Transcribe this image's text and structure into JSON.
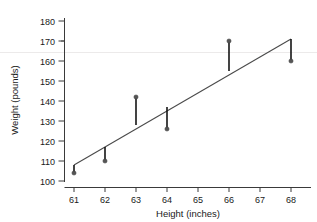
{
  "chart_data": {
    "type": "scatter",
    "title": "",
    "xlabel": "Height (inches)",
    "ylabel": "Weight (pounds)",
    "xlim": [
      60.4,
      68.6
    ],
    "ylim": [
      98,
      183
    ],
    "xticks": [
      61,
      62,
      63,
      64,
      65,
      66,
      67,
      68
    ],
    "yticks": [
      100,
      110,
      120,
      130,
      140,
      150,
      160,
      170,
      180
    ],
    "grid": false,
    "legend": null,
    "x": [
      61,
      62,
      63,
      64,
      66,
      68
    ],
    "y": [
      104,
      110,
      142,
      126,
      170,
      160
    ],
    "fitted": [
      108,
      117,
      128,
      137,
      155,
      171
    ],
    "residual_segments": [
      {
        "x": 61,
        "y_point": 104,
        "y_line": 108
      },
      {
        "x": 62,
        "y_point": 110,
        "y_line": 117
      },
      {
        "x": 63,
        "y_point": 142,
        "y_line": 128
      },
      {
        "x": 64,
        "y_point": 126,
        "y_line": 137
      },
      {
        "x": 66,
        "y_point": 170,
        "y_line": 155
      },
      {
        "x": 68,
        "y_point": 160,
        "y_line": 171
      }
    ],
    "trendline": {
      "x_start": 61,
      "y_start": 108,
      "x_end": 68,
      "y_end": 171
    },
    "colors": {
      "point": "#555555",
      "residual": "#151515",
      "trendline": "#4a4a4a",
      "axis": "#3a3a3a",
      "gridline": "#eceaea",
      "background": "#ffffff"
    }
  },
  "ytick_labels": [
    "100",
    "110",
    "120",
    "130",
    "140",
    "150",
    "160",
    "170",
    "180"
  ],
  "xtick_labels": [
    "61",
    "62",
    "63",
    "64",
    "65",
    "66",
    "67",
    "68"
  ],
  "labels": {
    "x_axis_title": "Height (inches)",
    "y_axis_title": "Weight (pounds)"
  }
}
